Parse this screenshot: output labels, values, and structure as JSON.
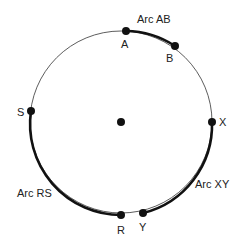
{
  "diagram": {
    "center": {
      "x": 121,
      "y": 122
    },
    "radius": 91,
    "points": [
      {
        "id": "A",
        "label": "A",
        "x": 126,
        "y": 31
      },
      {
        "id": "B",
        "label": "B",
        "x": 175,
        "y": 46
      },
      {
        "id": "S",
        "label": "S",
        "x": 31,
        "y": 111
      },
      {
        "id": "X",
        "label": "X",
        "x": 212,
        "y": 122
      },
      {
        "id": "R",
        "label": "R",
        "x": 121,
        "y": 215
      },
      {
        "id": "Y",
        "label": "Y",
        "x": 143,
        "y": 213
      }
    ],
    "arcs": [
      {
        "id": "AB",
        "label": "Arc AB"
      },
      {
        "id": "XY",
        "label": "Arc XY"
      },
      {
        "id": "RS",
        "label": "Arc RS"
      }
    ]
  }
}
